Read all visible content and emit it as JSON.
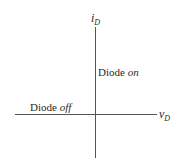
{
  "diagram": {
    "y_axis": {
      "var": "i",
      "sub": "D"
    },
    "x_axis": {
      "var": "v",
      "sub": "D"
    },
    "on_region": {
      "text": "Diode ",
      "state": "on"
    },
    "off_region": {
      "text": "Diode ",
      "state": "off"
    }
  }
}
